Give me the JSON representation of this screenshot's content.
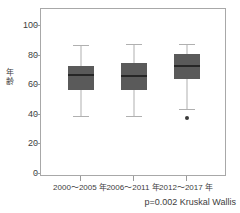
{
  "chart_data": {
    "type": "box",
    "title": "",
    "xlabel": "",
    "ylabel": "年齢",
    "ylabel_chars": [
      "年",
      "齢"
    ],
    "ylim": [
      0,
      110
    ],
    "yticks": [
      0,
      20,
      40,
      60,
      80,
      100
    ],
    "ytick_labels": [
      "0",
      "20",
      "40",
      "60",
      "80",
      "100"
    ],
    "grid": false,
    "legend": "none",
    "categories": [
      "2000〜2005 年",
      "2006〜2011 年",
      "2012〜2017 年"
    ],
    "boxes": [
      {
        "category": "2000〜2005 年",
        "whisker_low": 39,
        "q1": 57,
        "median": 67,
        "q3": 73,
        "whisker_high": 87,
        "outliers": []
      },
      {
        "category": "2006〜2011 年",
        "whisker_low": 39,
        "q1": 57,
        "median": 66,
        "q3": 75,
        "whisker_high": 88,
        "outliers": []
      },
      {
        "category": "2012〜2017 年",
        "whisker_low": 44,
        "q1": 64,
        "median": 73,
        "q3": 81,
        "whisker_high": 88,
        "outliers": [
          38
        ]
      }
    ],
    "annotations": [
      "p=0.002 Kruskal Wallis"
    ],
    "colors": {
      "box_fill": "#5a5a5a",
      "median": "#262626",
      "whisker": "#b0b0b0",
      "frame": "#a8a8a8",
      "outlier": "#3a3a3a",
      "text": "#3d3d3d",
      "background": "#ffffff"
    }
  },
  "footer": {
    "stat_text": "p=0.002 Kruskal Wallis"
  }
}
